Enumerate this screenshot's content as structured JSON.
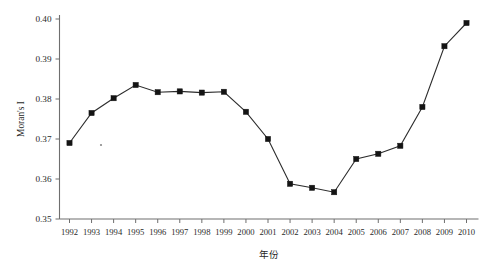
{
  "chart_data": {
    "type": "line",
    "title": "",
    "xlabel": "年份",
    "ylabel": "Moran's I",
    "xlim": [
      1991.4,
      2010.6
    ],
    "ylim": [
      0.35,
      0.4
    ],
    "grid": false,
    "legend": null,
    "marker": "filled-square",
    "line_color": "#2c2c2c",
    "marker_color": "#141414",
    "categories": [
      "1992",
      "1993",
      "1994",
      "1995",
      "1996",
      "1997",
      "1998",
      "1999",
      "2000",
      "2001",
      "2002",
      "2003",
      "2004",
      "2005",
      "2006",
      "2007",
      "2008",
      "2009",
      "2010"
    ],
    "x": [
      1992,
      1993,
      1994,
      1995,
      1996,
      1997,
      1998,
      1999,
      2000,
      2001,
      2002,
      2003,
      2004,
      2005,
      2006,
      2007,
      2008,
      2009,
      2010
    ],
    "values": [
      0.369,
      0.3765,
      0.3802,
      0.3835,
      0.3817,
      0.3819,
      0.3816,
      0.3818,
      0.3768,
      0.37,
      0.3588,
      0.3578,
      0.3567,
      0.365,
      0.3663,
      0.3683,
      0.378,
      0.3932,
      0.399
    ],
    "ytick_labels": [
      "0.35",
      "0.36",
      "0.37",
      "0.38",
      "0.39",
      "0.40"
    ],
    "ytick_values": [
      0.35,
      0.36,
      0.37,
      0.38,
      0.39,
      0.4
    ],
    "xtick_labels": [
      "1992",
      "1993",
      "1994",
      "1995",
      "1996",
      "1997",
      "1998",
      "1999",
      "2000",
      "2001",
      "2002",
      "2003",
      "2004",
      "2005",
      "2006",
      "2007",
      "2008",
      "2009",
      "2010"
    ]
  }
}
